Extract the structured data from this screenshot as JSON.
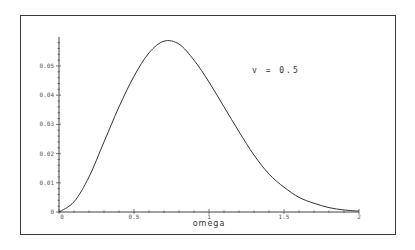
{
  "chart_data": {
    "type": "line",
    "title": "",
    "xlabel": "omega",
    "ylabel": "",
    "xlim": [
      0,
      2
    ],
    "ylim": [
      0,
      0.06
    ],
    "grid": false,
    "legend": null,
    "x_ticks": [
      "0",
      "0.5",
      "1",
      "1.5",
      "2"
    ],
    "y_ticks": [
      "0",
      "0.01",
      "0.02",
      "0.03",
      "0.04",
      "0.05"
    ],
    "annotations": [
      {
        "text": "v = 0.5",
        "x": 1.25,
        "y": 0.051
      }
    ],
    "series": [
      {
        "name": "v = 0.5",
        "x": [
          0,
          0.1,
          0.2,
          0.3,
          0.4,
          0.5,
          0.6,
          0.7,
          0.8,
          0.9,
          1.0,
          1.1,
          1.2,
          1.3,
          1.4,
          1.5,
          1.6,
          1.7,
          1.8,
          1.9,
          2.0
        ],
        "values": [
          0,
          0.0035,
          0.012,
          0.024,
          0.036,
          0.0465,
          0.0545,
          0.0585,
          0.0575,
          0.052,
          0.0445,
          0.036,
          0.0275,
          0.0195,
          0.013,
          0.0085,
          0.005,
          0.003,
          0.0015,
          0.0007,
          0.0003
        ]
      }
    ]
  }
}
